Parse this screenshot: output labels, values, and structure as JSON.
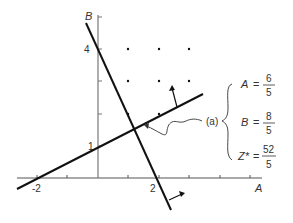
{
  "diagram": {
    "type": "linear-programming-graph",
    "axes": {
      "x_label": "A",
      "y_label": "B",
      "x_tick_labels": [
        "-2",
        "2"
      ],
      "y_tick_labels": [
        "1",
        "4"
      ]
    },
    "point_label": "(a)",
    "solution": [
      {
        "var": "A",
        "eq": "=",
        "num": "6",
        "den": "5"
      },
      {
        "var": "B",
        "eq": "=",
        "num": "8",
        "den": "5"
      },
      {
        "var": "Z*",
        "eq": "=",
        "num": "52",
        "den": "5"
      }
    ],
    "colors": {
      "line": "#111111",
      "axis": "#555555",
      "text": "#333333"
    }
  }
}
